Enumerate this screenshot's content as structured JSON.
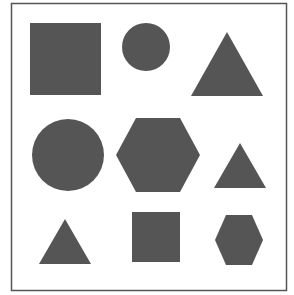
{
  "figure": {
    "background": "#ffffff",
    "border_color": "#555555",
    "fill_color": "#555555",
    "shapes": [
      {
        "type": "square",
        "row": 1,
        "col": 1,
        "size": "large"
      },
      {
        "type": "circle",
        "row": 1,
        "col": 2,
        "size": "small"
      },
      {
        "type": "triangle",
        "row": 1,
        "col": 3,
        "size": "large"
      },
      {
        "type": "circle",
        "row": 2,
        "col": 1,
        "size": "large"
      },
      {
        "type": "hexagon",
        "row": 2,
        "col": 2,
        "size": "large"
      },
      {
        "type": "triangle",
        "row": 2,
        "col": 3,
        "size": "small"
      },
      {
        "type": "triangle",
        "row": 3,
        "col": 1,
        "size": "small"
      },
      {
        "type": "square",
        "row": 3,
        "col": 2,
        "size": "small"
      },
      {
        "type": "hexagon",
        "row": 3,
        "col": 3,
        "size": "small"
      }
    ]
  }
}
